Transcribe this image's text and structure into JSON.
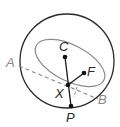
{
  "diagram": {
    "type": "geometry",
    "colors": {
      "outer_circle": "#2a2a2a",
      "ellipse": "#8a8a8a",
      "segments": "#1a1a1a",
      "dashed_chord": "#8a8a8a",
      "label_dark": "#2a2a2a",
      "label_light": "#8a8a8a",
      "point": "#111111"
    },
    "points": {
      "C": {
        "label": "C",
        "x": 65,
        "y": 57
      },
      "F": {
        "label": "F",
        "x": 84,
        "y": 73
      },
      "X": {
        "label": "X",
        "x": 68,
        "y": 85
      },
      "P": {
        "label": "P",
        "x": 71,
        "y": 106
      },
      "A": {
        "label": "A",
        "x": 19,
        "y": 66
      },
      "B": {
        "label": "B",
        "x": 98,
        "y": 99
      }
    },
    "labels": {
      "A": "A",
      "B": "B",
      "C": "C",
      "F": "F",
      "X": "X",
      "P": "P"
    },
    "shapes": {
      "outer_circle": {
        "cx": 67,
        "cy": 61,
        "r": 47
      },
      "ellipse": {
        "cx": 70,
        "cy": 63,
        "rx": 38,
        "ry": 18,
        "rotate_deg": 27
      }
    }
  }
}
